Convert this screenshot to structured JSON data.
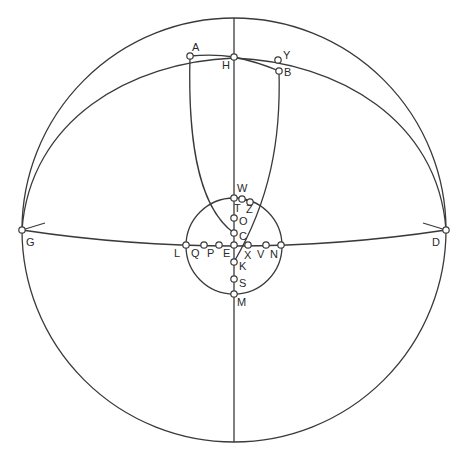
{
  "diagram": {
    "type": "geometric-construction",
    "outer_circle": {
      "cx": 234,
      "cy": 230,
      "r": 212
    },
    "inner_circle": {
      "cx": 234,
      "cy": 246,
      "r": 48
    },
    "points": [
      {
        "id": "A",
        "label": "A",
        "x": 190,
        "y": 56,
        "lx": 192,
        "ly": 51
      },
      {
        "id": "H",
        "label": "H",
        "x": 234,
        "y": 57,
        "lx": 222,
        "ly": 69
      },
      {
        "id": "Y",
        "label": "Y",
        "x": 278,
        "y": 60,
        "lx": 283,
        "ly": 59
      },
      {
        "id": "B",
        "label": "B",
        "x": 279,
        "y": 71,
        "lx": 284,
        "ly": 76
      },
      {
        "id": "G",
        "label": "G",
        "x": 22,
        "y": 230,
        "lx": 26,
        "ly": 246
      },
      {
        "id": "D",
        "label": "D",
        "x": 446,
        "y": 230,
        "lx": 432,
        "ly": 246
      },
      {
        "id": "W",
        "label": "W",
        "x": 234,
        "y": 198,
        "lx": 237,
        "ly": 192
      },
      {
        "id": "T",
        "label": "T",
        "x": 242,
        "y": 199,
        "lx": 234,
        "ly": 212
      },
      {
        "id": "Z",
        "label": "Z",
        "x": 250,
        "y": 202,
        "lx": 246,
        "ly": 213
      },
      {
        "id": "O",
        "label": "O",
        "x": 234,
        "y": 218,
        "lx": 239,
        "ly": 225
      },
      {
        "id": "C",
        "label": "C",
        "x": 234,
        "y": 233,
        "lx": 239,
        "ly": 240
      },
      {
        "id": "L",
        "label": "L",
        "x": 186,
        "y": 245,
        "lx": 174,
        "ly": 257
      },
      {
        "id": "Q",
        "label": "Q",
        "x": 204,
        "y": 245,
        "lx": 191,
        "ly": 257
      },
      {
        "id": "P",
        "label": "P",
        "x": 219,
        "y": 245,
        "lx": 207,
        "ly": 257
      },
      {
        "id": "E",
        "label": "E",
        "x": 234,
        "y": 245,
        "lx": 223,
        "ly": 257
      },
      {
        "id": "X",
        "label": "X",
        "x": 248,
        "y": 245,
        "lx": 244,
        "ly": 259
      },
      {
        "id": "V",
        "label": "V",
        "x": 266,
        "y": 245,
        "lx": 257,
        "ly": 258
      },
      {
        "id": "N",
        "label": "N",
        "x": 281,
        "y": 245,
        "lx": 270,
        "ly": 258
      },
      {
        "id": "K",
        "label": "K",
        "x": 234,
        "y": 262,
        "lx": 239,
        "ly": 270
      },
      {
        "id": "S",
        "label": "S",
        "x": 234,
        "y": 279,
        "lx": 239,
        "ly": 287
      },
      {
        "id": "M",
        "label": "M",
        "x": 234,
        "y": 294,
        "lx": 237,
        "ly": 306
      }
    ],
    "colors": {
      "stroke": "#3a3a3a",
      "background": "#ffffff",
      "point_fill": "#ffffff"
    }
  }
}
